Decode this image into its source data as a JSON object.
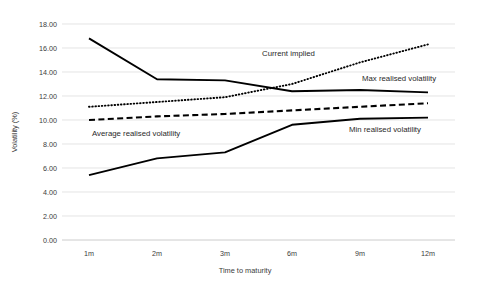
{
  "chart_data": {
    "type": "line",
    "title": "",
    "xlabel": "Time to maturity",
    "ylabel": "Volatility (%)",
    "categories": [
      "1m",
      "2m",
      "3m",
      "6m",
      "9m",
      "12m"
    ],
    "ylim": [
      0.0,
      18.0
    ],
    "ytick_labels": [
      "0.00",
      "2.00",
      "4.00",
      "6.00",
      "8.00",
      "10.00",
      "12.00",
      "14.00",
      "16.00",
      "18.00"
    ],
    "ytick_values": [
      0.0,
      2.0,
      4.0,
      6.0,
      8.0,
      10.0,
      12.0,
      14.0,
      16.0,
      18.0
    ],
    "grid": true,
    "legend_position": "inline-annotations",
    "series": [
      {
        "name": "Max realised volatility",
        "style": "solid",
        "color": "#000000",
        "values": [
          16.8,
          13.4,
          13.3,
          12.4,
          12.5,
          12.3
        ],
        "annotation": "Max realised volatility"
      },
      {
        "name": "Current implied",
        "style": "dotted",
        "color": "#000000",
        "values": [
          11.1,
          11.5,
          11.9,
          13.0,
          14.8,
          16.3
        ],
        "annotation": "Current implied"
      },
      {
        "name": "Average realised volatility",
        "style": "dashed",
        "color": "#000000",
        "values": [
          10.0,
          10.3,
          10.5,
          10.8,
          11.1,
          11.4
        ],
        "annotation": "Average realised volatility"
      },
      {
        "name": "Min realised volatility",
        "style": "solid",
        "color": "#000000",
        "values": [
          5.4,
          6.8,
          7.3,
          9.6,
          10.1,
          10.2
        ],
        "annotation": "Min realised volatility"
      }
    ],
    "annotations": [
      {
        "text": "Current implied",
        "x": 262,
        "y": 56
      },
      {
        "text": "Max realised volatility",
        "x": 362,
        "y": 81
      },
      {
        "text": "Average realised volatility",
        "x": 92,
        "y": 136
      },
      {
        "text": "Min realised volatility",
        "x": 349,
        "y": 132
      }
    ]
  }
}
